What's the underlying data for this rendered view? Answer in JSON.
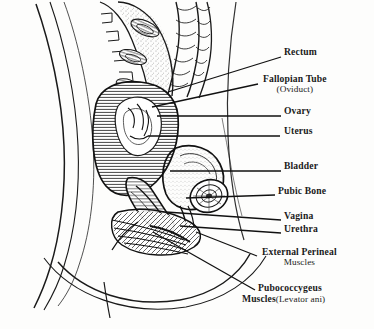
{
  "figure": {
    "view": "mid-sagittal section, left lateral view",
    "style": "black-and-white pen-and-ink line drawing with stipple and hatch shading",
    "line_color": "#1a1a1a",
    "background_color": "#fdfdfc"
  },
  "labels": [
    {
      "id": "rectum",
      "text": "Rectum",
      "sub": "",
      "x": 284,
      "y": 52,
      "leader_from": [
        282,
        58
      ],
      "leader_to": [
        168,
        92
      ]
    },
    {
      "id": "fallopian-tube",
      "text": "Fallopian Tube",
      "sub": "(Oviduct)",
      "x": 263,
      "y": 79,
      "leader_from": [
        259,
        85
      ],
      "leader_to": [
        155,
        106
      ]
    },
    {
      "id": "ovary",
      "text": "Ovary",
      "sub": "",
      "x": 284,
      "y": 111,
      "leader_from": [
        282,
        117
      ],
      "leader_to": [
        158,
        117
      ]
    },
    {
      "id": "uterus",
      "text": "Uterus",
      "sub": "",
      "x": 284,
      "y": 131,
      "leader_from": [
        281,
        137
      ],
      "leader_to": [
        150,
        137
      ]
    },
    {
      "id": "bladder",
      "text": "Bladder",
      "sub": "",
      "x": 284,
      "y": 166,
      "leader_from": [
        282,
        172
      ],
      "leader_to": [
        172,
        172
      ]
    },
    {
      "id": "pubic-bone",
      "text": "Pubic Bone",
      "sub": "",
      "x": 278,
      "y": 191,
      "leader_from": [
        276,
        196
      ],
      "leader_to": [
        186,
        199
      ]
    },
    {
      "id": "vagina",
      "text": "Vagina",
      "sub": "",
      "x": 284,
      "y": 216,
      "leader_from": [
        282,
        221
      ],
      "leader_to": [
        168,
        213
      ]
    },
    {
      "id": "urethra",
      "text": "Urethra",
      "sub": "",
      "x": 284,
      "y": 229,
      "leader_from": [
        282,
        234
      ],
      "leader_to": [
        182,
        227
      ]
    },
    {
      "id": "external-perineal-muscles",
      "text": "External Perineal",
      "sub": "Muscles",
      "x": 262,
      "y": 252,
      "leader_from": [
        258,
        257
      ],
      "leader_to": [
        196,
        233
      ]
    },
    {
      "id": "pubococcygeus-muscles",
      "text": "Pubococcygeus",
      "sub": "Muscles",
      "inline_sub": "(Levator ani)",
      "x": 258,
      "y": 288,
      "leader_from": [
        256,
        291
      ],
      "leader_to": [
        155,
        233
      ]
    }
  ],
  "anatomy_regions": [
    "sacral vertebrae",
    "rectum",
    "sigmoid colon",
    "fallopian tube",
    "ovary",
    "uterus",
    "bladder",
    "pubic bone",
    "vagina",
    "urethra",
    "external perineal muscles",
    "pubococcygeus muscles",
    "abdominal wall",
    "perineum"
  ]
}
